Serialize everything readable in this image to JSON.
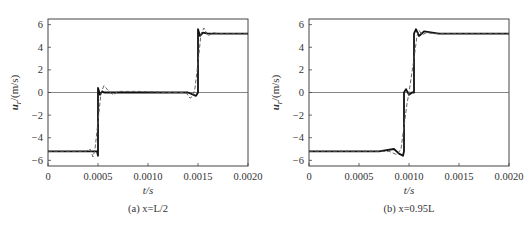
{
  "top_caption_fragment": "",
  "bottom_caption_fragment": "",
  "chart_data": [
    {
      "type": "line",
      "title": "",
      "subcaption_prefix": "(a)",
      "subcaption": "(a) x=L/2",
      "xlabel": "t/s",
      "ylabel": "u_r/(m/s)",
      "xlim": [
        0,
        0.002
      ],
      "ylim": [
        -6.5,
        6.5
      ],
      "xticks": [
        0,
        0.0005,
        0.001,
        0.0015,
        0.002
      ],
      "xtick_labels": [
        "0",
        "0.0005",
        "0.0010",
        "0.0015",
        "0.0020"
      ],
      "yticks": [
        -6,
        -4,
        -2,
        0,
        2,
        4,
        6
      ],
      "ytick_labels": [
        "-6",
        "-4",
        "-2",
        "0",
        "2",
        "4",
        "6"
      ],
      "reference_line_y": 0,
      "grid": false,
      "legend": null,
      "series": [
        {
          "name": "exact (solid)",
          "style": "solid-thick",
          "x": [
            0,
            0.00049,
            0.0005,
            0.0005,
            0.00052,
            0.00054,
            0.00056,
            0.0006,
            0.0014,
            0.00148,
            0.0015,
            0.0015,
            0.00152,
            0.00155,
            0.0016,
            0.002
          ],
          "y": [
            -5.2,
            -5.2,
            -5.6,
            0.4,
            -0.2,
            0.1,
            0.0,
            0.0,
            0.0,
            -0.3,
            0.0,
            5.6,
            5.0,
            5.3,
            5.2,
            5.2
          ]
        },
        {
          "name": "numerical (dashed)",
          "style": "dashed",
          "x": [
            0,
            0.00038,
            0.00042,
            0.00045,
            0.00047,
            0.0005,
            0.00053,
            0.00056,
            0.0006,
            0.00065,
            0.0007,
            0.0009,
            0.0012,
            0.00138,
            0.00142,
            0.00145,
            0.00147,
            0.0015,
            0.00153,
            0.00156,
            0.0016,
            0.00165,
            0.0017,
            0.002
          ],
          "y": [
            -5.2,
            -5.2,
            -5.0,
            -5.7,
            -5.0,
            -2.6,
            0.0,
            0.6,
            0.2,
            -0.2,
            0.1,
            0.1,
            0.0,
            0.0,
            -0.5,
            -0.3,
            0.4,
            2.6,
            5.2,
            5.7,
            5.0,
            5.3,
            5.2,
            5.2
          ]
        }
      ]
    },
    {
      "type": "line",
      "title": "",
      "subcaption_prefix": "(b)",
      "subcaption": "(b) x=0.95L",
      "xlabel": "t/s",
      "ylabel": "u_r/(m/s)",
      "xlim": [
        0,
        0.002
      ],
      "ylim": [
        -6.5,
        6.5
      ],
      "xticks": [
        0,
        0.0005,
        0.001,
        0.0015,
        0.002
      ],
      "xtick_labels": [
        "0",
        "0.0005",
        "0.0010",
        "0.0015",
        "0.0020"
      ],
      "yticks": [
        -6,
        -4,
        -2,
        0,
        2,
        4,
        6
      ],
      "ytick_labels": [
        "-6",
        "-4",
        "-2",
        "0",
        "2",
        "4",
        "6"
      ],
      "reference_line_y": 0,
      "grid": false,
      "legend": null,
      "series": [
        {
          "name": "exact (solid)",
          "style": "solid-thick",
          "x": [
            0,
            0.0007,
            0.00085,
            0.0009,
            0.00094,
            0.00095,
            0.00095,
            0.00097,
            0.001,
            0.00103,
            0.00105,
            0.00105,
            0.00107,
            0.0011,
            0.00115,
            0.0013,
            0.002
          ],
          "y": [
            -5.2,
            -5.2,
            -5.0,
            -5.4,
            -5.6,
            -5.2,
            0.0,
            0.3,
            -0.2,
            0.0,
            0.0,
            5.2,
            5.6,
            5.0,
            5.4,
            5.2,
            5.2
          ]
        },
        {
          "name": "numerical (dashed)",
          "style": "dashed",
          "x": [
            0,
            0.0008,
            0.00088,
            0.00092,
            0.00095,
            0.00098,
            0.001,
            0.00102,
            0.00105,
            0.00108,
            0.0011,
            0.00113,
            0.00118,
            0.00125,
            0.002
          ],
          "y": [
            -5.2,
            -5.2,
            -5.5,
            -5.0,
            -3.0,
            -1.0,
            0.0,
            1.2,
            3.0,
            5.0,
            5.5,
            5.1,
            5.3,
            5.2,
            5.2
          ]
        }
      ]
    }
  ]
}
